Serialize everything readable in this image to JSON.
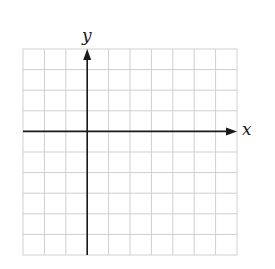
{
  "chart_data": {
    "type": "coordinate-grid",
    "title": "",
    "xlabel": "x",
    "ylabel": "y",
    "grid": true,
    "columns": 10,
    "rows": 10,
    "y_axis_column": 3,
    "x_axis_row": 4,
    "x_range_units": [
      -3,
      7
    ],
    "y_range_units": [
      -6,
      4
    ],
    "tick_labels": [],
    "series": []
  },
  "colors": {
    "grid": "#cfcfcf",
    "axis": "#1a1a1a",
    "background": "#ffffff"
  },
  "geometry": {
    "left": 23,
    "top": 49,
    "right": 237,
    "bottom": 255
  }
}
